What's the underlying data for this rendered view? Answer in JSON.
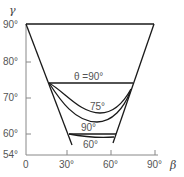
{
  "axes": {
    "y_label": "γ",
    "x_label": "β",
    "y_ticks": [
      "90°",
      "80°",
      "70°",
      "60°",
      "54°"
    ],
    "x_ticks": [
      "0",
      "30°",
      "60°",
      "90°"
    ]
  },
  "curves": {
    "theta_label": "θ =90°",
    "curve_75_label": "75°",
    "curve_90_label": "90°",
    "curve_60_label": "60°"
  },
  "colors": {
    "line": "#1a1a1a",
    "axis": "#888888",
    "text": "#555555"
  }
}
